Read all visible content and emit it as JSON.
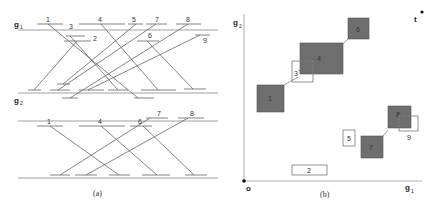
{
  "panel_a": {
    "caption": "(a)",
    "top": {
      "axis_label": "g",
      "axis_sub1": "1",
      "axis_label2": "g",
      "axis_sub2": "2",
      "labels": [
        "1",
        "3",
        "4",
        "5",
        "7",
        "8",
        "2",
        "6",
        "9"
      ]
    },
    "bottom": {
      "axis_label": "g",
      "axis_sub": "2",
      "labels": [
        "1",
        "4",
        "6",
        "7",
        "8"
      ]
    }
  },
  "panel_b": {
    "caption": "(b)",
    "y_axis_label": "g",
    "y_axis_sub": "2",
    "x_axis_label": "g",
    "x_axis_sub": "1",
    "origin_label": "o",
    "target_label": "t",
    "boxes": [
      {
        "id": "1",
        "filled": true
      },
      {
        "id": "2",
        "filled": false
      },
      {
        "id": "3",
        "filled": false
      },
      {
        "id": "4",
        "filled": true
      },
      {
        "id": "5",
        "filled": false
      },
      {
        "id": "6",
        "filled": true
      },
      {
        "id": "7",
        "filled": true
      },
      {
        "id": "8",
        "filled": true
      },
      {
        "id": "9",
        "filled": false
      }
    ]
  },
  "colors": {
    "filled_box": "#6e6e6e",
    "line": "#555555",
    "axis": "#888888"
  }
}
